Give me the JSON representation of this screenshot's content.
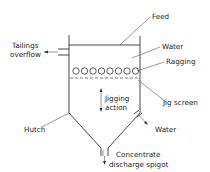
{
  "diagram": {
    "labels": {
      "feed": "Feed",
      "water_top": "Water",
      "ragging": "Ragging",
      "tailings_line1": "Tailings",
      "tailings_line2": "overflow",
      "jigging_line1": "Jigging",
      "jigging_line2": "action",
      "jig_screen": "Jig screen",
      "hutch": "Hutch",
      "water_bottom": "Water",
      "concentrate_line1": "Concentrate",
      "concentrate_line2": "discharge spigot"
    },
    "ragging_circle_count": 8
  }
}
